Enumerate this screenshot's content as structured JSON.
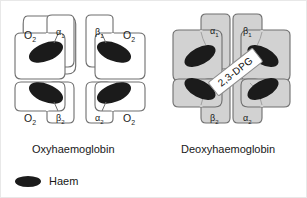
{
  "figure": {
    "title_left": "Oxyhaemoglobin",
    "title_right": "Deoxyhaemoglobin"
  },
  "legend": {
    "haem_label": "Haem",
    "haem_icon": "haem-ellipse-icon",
    "haem_color": "#1b1b1b"
  },
  "colors": {
    "oxy_fill": "#ffffff",
    "deoxy_fill": "#d2d2d2",
    "outline": "#6e6e6e",
    "haem": "#1b1b1b",
    "text": "#181818"
  },
  "oxyhaemoglobin": {
    "subunits": [
      {
        "name": "alpha-1",
        "greek": "α",
        "subscript": "1",
        "position": "top-left"
      },
      {
        "name": "beta-1",
        "greek": "β",
        "subscript": "1",
        "position": "top-right"
      },
      {
        "name": "beta-2",
        "greek": "β",
        "subscript": "2",
        "position": "bottom-left"
      },
      {
        "name": "alpha-2",
        "greek": "α",
        "subscript": "2",
        "position": "bottom-right"
      }
    ],
    "oxygen_labels": [
      {
        "text": "O",
        "subscript": "2",
        "position": "top-left"
      },
      {
        "text": "O",
        "subscript": "2",
        "position": "top-right"
      },
      {
        "text": "O",
        "subscript": "2",
        "position": "bottom-left"
      },
      {
        "text": "O",
        "subscript": "2",
        "position": "bottom-right"
      }
    ]
  },
  "deoxyhaemoglobin": {
    "subunits": [
      {
        "name": "alpha-1",
        "greek": "α",
        "subscript": "1",
        "position": "top-left"
      },
      {
        "name": "beta-1",
        "greek": "β",
        "subscript": "1",
        "position": "top-right"
      },
      {
        "name": "beta-2",
        "greek": "β",
        "subscript": "2",
        "position": "bottom-left"
      },
      {
        "name": "alpha-2",
        "greek": "α",
        "subscript": "2",
        "position": "bottom-right"
      }
    ],
    "center_molecule": "2,3-DPG"
  }
}
